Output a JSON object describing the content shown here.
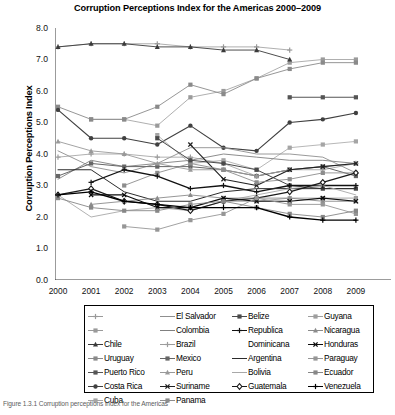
{
  "title": "Corruption Perceptions Index for the Americas 2000–2009",
  "caption": "Figure 1.3.1  Corruption perceptions index for the Americas",
  "axes": {
    "ylabel": "Corruption Perceptions Index",
    "xlabel": "",
    "yticks": [
      "0.0",
      "1.0",
      "2.0",
      "3.0",
      "4.0",
      "5.0",
      "6.0",
      "7.0",
      "8.0"
    ],
    "xticks": [
      "2000",
      "2001",
      "2002",
      "2003",
      "2004",
      "2005",
      "2006",
      "2007",
      "2008",
      "2009"
    ]
  },
  "chart_data": {
    "type": "line",
    "title": "Corruption Perceptions Index for the Americas 2000–2009",
    "xlabel": "",
    "ylabel": "Corruption Perceptions Index",
    "x": [
      2000,
      2001,
      2002,
      2003,
      2004,
      2005,
      2006,
      2007,
      2008,
      2009
    ],
    "ylim": [
      0.0,
      8.0
    ],
    "xlim": [
      2000,
      2009
    ],
    "grid": false,
    "legend_position": "below-plot",
    "series": [
      {
        "name": "",
        "marker": "plus",
        "color": "#9a9a9a",
        "width": 0.8,
        "values": [
          7.4,
          7.5,
          7.5,
          7.5,
          7.4,
          7.4,
          7.4,
          7.3,
          null,
          null
        ]
      },
      {
        "name": "",
        "marker": "square",
        "color": "#9a9a9a",
        "width": 0.8,
        "values": [
          null,
          5.1,
          5.1,
          4.9,
          5.8,
          6.0,
          6.4,
          6.9,
          7.0,
          7.0
        ]
      },
      {
        "name": "Chile",
        "marker": "triangle",
        "color": "#3a3a3a",
        "width": 0.9,
        "values": [
          7.4,
          7.5,
          7.5,
          7.4,
          7.4,
          7.3,
          7.3,
          7.0,
          null,
          null
        ]
      },
      {
        "name": "Uruguay",
        "marker": "square",
        "color": "#8a8a8a",
        "width": 0.9,
        "values": [
          5.5,
          5.1,
          5.1,
          5.5,
          6.2,
          5.9,
          6.4,
          6.7,
          6.9,
          6.9
        ]
      },
      {
        "name": "Puerto Rico",
        "marker": "square",
        "color": "#555555",
        "width": 1.1,
        "values": [
          null,
          null,
          null,
          null,
          null,
          null,
          null,
          5.8,
          5.8,
          5.8
        ]
      },
      {
        "name": "Costa Rica",
        "marker": "circle",
        "color": "#404040",
        "width": 1.1,
        "values": [
          5.4,
          4.5,
          4.5,
          4.3,
          4.9,
          4.2,
          4.1,
          5.0,
          5.1,
          5.3
        ]
      },
      {
        "name": "Cuba",
        "marker": "square",
        "color": "#a5a5a5",
        "width": 0.8,
        "values": [
          null,
          null,
          null,
          4.6,
          3.7,
          3.8,
          3.5,
          4.2,
          4.3,
          4.4
        ]
      },
      {
        "name": "El Salvador",
        "marker": "none",
        "color": "#8f8f8f",
        "width": 0.9,
        "values": [
          4.1,
          3.6,
          3.4,
          3.7,
          4.2,
          4.2,
          4.0,
          4.0,
          3.9,
          3.4
        ]
      },
      {
        "name": "Colombia",
        "marker": "none",
        "color": "#808080",
        "width": 0.9,
        "values": [
          3.2,
          3.8,
          3.6,
          3.7,
          3.8,
          4.0,
          3.9,
          3.8,
          3.8,
          3.7
        ]
      },
      {
        "name": "Brazil",
        "marker": "plus",
        "color": "#9c9c9c",
        "width": 0.8,
        "values": [
          3.9,
          4.0,
          4.0,
          3.9,
          3.9,
          3.7,
          3.3,
          3.5,
          3.5,
          3.7
        ]
      },
      {
        "name": "Mexico",
        "marker": "square",
        "color": "#666666",
        "width": 1.0,
        "values": [
          3.3,
          3.7,
          3.6,
          3.6,
          3.6,
          3.5,
          3.3,
          3.5,
          3.6,
          3.3
        ]
      },
      {
        "name": "Peru",
        "marker": "triangle",
        "color": "#999999",
        "width": 0.9,
        "values": [
          4.4,
          4.1,
          4.0,
          3.7,
          3.5,
          3.5,
          3.3,
          3.5,
          3.6,
          3.7
        ]
      },
      {
        "name": "Suriname",
        "marker": "x",
        "color": "#202020",
        "width": 1.1,
        "values": [
          null,
          null,
          null,
          null,
          4.3,
          3.2,
          3.0,
          3.5,
          3.6,
          3.7
        ]
      },
      {
        "name": "Panama",
        "marker": "square",
        "color": "#8d8d8d",
        "width": 0.9,
        "values": [
          null,
          null,
          3.0,
          3.4,
          3.7,
          3.5,
          3.1,
          3.2,
          3.4,
          3.4
        ]
      },
      {
        "name": "Belize",
        "marker": "square",
        "color": "#4a4a4a",
        "width": 1.0,
        "values": [
          null,
          null,
          null,
          4.5,
          3.8,
          3.7,
          3.5,
          3.0,
          2.9,
          2.9
        ]
      },
      {
        "name": "Republica Dominicana",
        "marker": "plus",
        "color": "#111111",
        "width": 1.3,
        "values": [
          null,
          3.1,
          3.5,
          3.3,
          2.9,
          3.0,
          2.8,
          3.0,
          3.0,
          3.0
        ]
      },
      {
        "name": "Argentina",
        "marker": "none",
        "color": "#2b2b2b",
        "width": 1.0,
        "values": [
          3.5,
          3.5,
          2.8,
          2.5,
          2.5,
          2.8,
          2.9,
          2.9,
          2.9,
          2.9
        ]
      },
      {
        "name": "Bolivia",
        "marker": "none",
        "color": "#a8a8a8",
        "width": 0.9,
        "values": [
          2.7,
          2.0,
          2.2,
          2.3,
          2.2,
          2.5,
          2.7,
          2.9,
          3.0,
          2.7
        ]
      },
      {
        "name": "Guatemala",
        "marker": "diamond",
        "color": "#1a1a1a",
        "width": 1.2,
        "values": [
          2.7,
          2.9,
          2.5,
          2.4,
          2.2,
          2.5,
          2.6,
          2.8,
          3.1,
          3.4
        ]
      },
      {
        "name": "Guyana",
        "marker": "square",
        "color": "#9e9e9e",
        "width": 0.9,
        "values": [
          null,
          null,
          null,
          null,
          null,
          2.5,
          2.5,
          2.6,
          2.6,
          2.6
        ]
      },
      {
        "name": "Nicaragua",
        "marker": "triangle",
        "color": "#8b8b8b",
        "width": 0.9,
        "values": [
          null,
          2.4,
          2.5,
          2.6,
          2.7,
          2.6,
          2.6,
          2.6,
          2.5,
          2.5
        ]
      },
      {
        "name": "Honduras",
        "marker": "x",
        "color": "#0d0d0d",
        "width": 1.2,
        "values": [
          null,
          2.7,
          2.7,
          2.3,
          2.3,
          2.6,
          2.5,
          2.5,
          2.6,
          2.5
        ]
      },
      {
        "name": "Paraguay",
        "marker": "square",
        "color": "#969696",
        "width": 0.9,
        "values": [
          null,
          null,
          1.7,
          1.6,
          1.9,
          2.1,
          2.6,
          2.4,
          2.4,
          2.1
        ]
      },
      {
        "name": "Ecuador",
        "marker": "square",
        "color": "#878787",
        "width": 0.9,
        "values": [
          2.6,
          2.3,
          2.2,
          2.2,
          2.4,
          2.5,
          2.3,
          2.1,
          2.0,
          2.2
        ]
      },
      {
        "name": "Venezuela",
        "marker": "plus",
        "color": "#000000",
        "width": 1.3,
        "values": [
          2.7,
          2.8,
          2.5,
          2.4,
          2.3,
          2.3,
          2.3,
          2.0,
          1.9,
          1.9
        ]
      }
    ]
  },
  "legend": {
    "columns": [
      [
        {
          "label": "",
          "marker": "plus",
          "color": "#9a9a9a"
        },
        {
          "label": "",
          "marker": "square",
          "color": "#9a9a9a"
        },
        {
          "label": "Chile",
          "marker": "triangle",
          "color": "#3a3a3a"
        },
        {
          "label": "Uruguay",
          "marker": "square",
          "color": "#8a8a8a"
        },
        {
          "label": "Puerto Rico",
          "marker": "square",
          "color": "#555555"
        },
        {
          "label": "Costa Rica",
          "marker": "circle",
          "color": "#404040"
        },
        {
          "label": "Cuba",
          "marker": "square",
          "color": "#a5a5a5"
        }
      ],
      [
        {
          "label": "El Salvador",
          "marker": "none",
          "color": "#8f8f8f"
        },
        {
          "label": "Colombia",
          "marker": "none",
          "color": "#808080"
        },
        {
          "label": "Brazil",
          "marker": "plus",
          "color": "#9c9c9c"
        },
        {
          "label": "Mexico",
          "marker": "square",
          "color": "#666666"
        },
        {
          "label": "Peru",
          "marker": "triangle",
          "color": "#999999"
        },
        {
          "label": "Suriname",
          "marker": "x",
          "color": "#202020"
        },
        {
          "label": "Panama",
          "marker": "square",
          "color": "#8d8d8d"
        }
      ],
      [
        {
          "label": "Belize",
          "marker": "square",
          "color": "#4a4a4a"
        },
        {
          "label": "Republica",
          "marker": "plus",
          "color": "#111111"
        },
        {
          "label": "Dominicana",
          "marker": "cont",
          "color": "#111111"
        },
        {
          "label": "Argentina",
          "marker": "none",
          "color": "#2b2b2b"
        },
        {
          "label": "Bolivia",
          "marker": "none",
          "color": "#a8a8a8"
        },
        {
          "label": "Guatemala",
          "marker": "diamond",
          "color": "#1a1a1a"
        }
      ],
      [
        {
          "label": "Guyana",
          "marker": "square",
          "color": "#9e9e9e"
        },
        {
          "label": "Nicaragua",
          "marker": "triangle",
          "color": "#8b8b8b"
        },
        {
          "label": "Honduras",
          "marker": "x",
          "color": "#0d0d0d"
        },
        {
          "label": "Paraguay",
          "marker": "square",
          "color": "#969696"
        },
        {
          "label": "Ecuador",
          "marker": "square",
          "color": "#878787"
        },
        {
          "label": "Venezuela",
          "marker": "plus",
          "color": "#000000"
        }
      ]
    ]
  }
}
